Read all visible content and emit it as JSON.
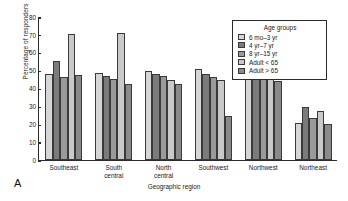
{
  "panel": {
    "letter": "A"
  },
  "legend": {
    "title": "Age groups",
    "position": "top-right",
    "entries": [
      {
        "label": "6 mo–3 yr",
        "color": "#d6d6d6"
      },
      {
        "label": "4 yr–7 yr",
        "color": "#7b7b7b"
      },
      {
        "label": "8 yr–15 yr",
        "color": "#9a9a9a"
      },
      {
        "label": "Adult < 65",
        "color": "#c9c9c9"
      },
      {
        "label": "Adult > 65",
        "color": "#8a8a8a"
      }
    ]
  },
  "chart_data": {
    "type": "bar",
    "title": "",
    "xlabel": "Geographic region",
    "ylabel": "Percentage of responders",
    "ylim": [
      0,
      80
    ],
    "yticks": [
      0,
      10,
      20,
      30,
      40,
      50,
      60,
      70,
      80
    ],
    "grid": false,
    "categories": [
      "Southeast",
      "South central",
      "North central",
      "Southwest",
      "Northwest",
      "Northeast"
    ],
    "series": [
      {
        "name": "6 mo–3 yr",
        "color": "#d6d6d6",
        "values": [
          48.5,
          49.0,
          50.0,
          51.0,
          56.5,
          20.5
        ]
      },
      {
        "name": "4 yr–7 yr",
        "color": "#7b7b7b",
        "values": [
          56.0,
          47.5,
          48.5,
          48.5,
          49.0,
          29.5
        ]
      },
      {
        "name": "8 yr–15 yr",
        "color": "#9a9a9a",
        "values": [
          46.8,
          45.5,
          47.5,
          46.8,
          48.0,
          23.5
        ]
      },
      {
        "name": "Adult < 65",
        "color": "#c9c9c9",
        "values": [
          71.0,
          71.5,
          45.0,
          45.0,
          46.0,
          27.5
        ]
      },
      {
        "name": "Adult > 65",
        "color": "#8a8a8a",
        "values": [
          48.0,
          42.5,
          43.0,
          24.5,
          44.5,
          20.0
        ]
      }
    ]
  }
}
